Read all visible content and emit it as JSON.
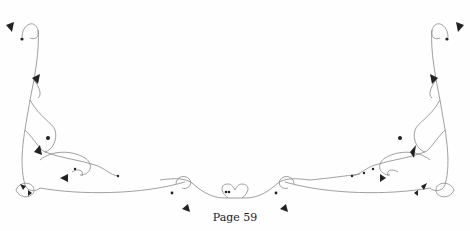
{
  "page": {
    "footer_text": "Page 59",
    "ornament_color": "#222222",
    "line_color": "#777777"
  },
  "ornaments": {
    "left_corner": "floral-flourish-left",
    "right_corner": "floral-flourish-right",
    "bottom_center": "heart-scroll-ornament"
  }
}
